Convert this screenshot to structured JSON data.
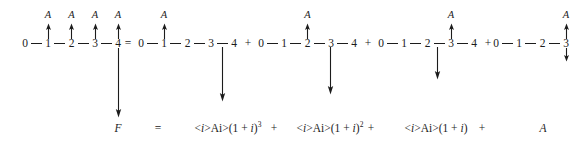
{
  "figure": {
    "kind": "cash-flow-diagram",
    "colors": {
      "ink": "#1c1c1c",
      "background": "#ffffff"
    },
    "annual_label": "A",
    "timelines": [
      {
        "id": "timeline-left",
        "nodes": [
          "0",
          "1",
          "2",
          "3",
          "4"
        ],
        "x": [
          25,
          48,
          71.5,
          95,
          118
        ],
        "arrows_up_at": [
          "1",
          "2",
          "3",
          "4"
        ]
      },
      {
        "id": "timeline-1",
        "nodes": [
          "0",
          "1",
          "2",
          "3",
          "4"
        ],
        "x": [
          141,
          164,
          187.5,
          211,
          234
        ],
        "arrows_up_at": [
          "1"
        ]
      },
      {
        "id": "timeline-2",
        "nodes": [
          "0",
          "1",
          "2",
          "3",
          "4"
        ],
        "x": [
          261,
          284,
          307.5,
          331,
          354
        ],
        "arrows_up_at": [
          "2"
        ]
      },
      {
        "id": "timeline-3",
        "nodes": [
          "0",
          "1",
          "2",
          "3",
          "4"
        ],
        "x": [
          381,
          404,
          427.5,
          451,
          474
        ],
        "arrows_up_at": [
          "3"
        ]
      },
      {
        "id": "timeline-4",
        "nodes": [
          "0",
          "1",
          "2",
          "3",
          "4"
        ],
        "x": [
          476,
          499,
          522.5,
          546,
          546
        ],
        "arrows_up_at": [
          "4"
        ],
        "arrow_down_at": [
          "4"
        ]
      }
    ],
    "operators": [
      {
        "symbol": "=",
        "x": 128
      },
      {
        "symbol": "+",
        "x": 248
      },
      {
        "symbol": "+",
        "x": 368
      },
      {
        "symbol": "+",
        "x": 488
      }
    ],
    "equation": {
      "terms": [
        {
          "text": "F",
          "italic": true,
          "x": 118,
          "y": 122
        },
        {
          "text": "=",
          "x": 158,
          "y": 122
        },
        {
          "text": "A(1 + i)",
          "exponent": "3",
          "x": 228,
          "y": 122
        },
        {
          "text": "+",
          "x": 274,
          "y": 122
        },
        {
          "text": "A(1 + i)",
          "exponent": "2",
          "x": 330,
          "y": 122
        },
        {
          "text": "+",
          "x": 371,
          "y": 122
        },
        {
          "text": "A(1 + i)",
          "exponent": "",
          "x": 436,
          "y": 122
        },
        {
          "text": "+",
          "x": 482,
          "y": 122
        },
        {
          "text": "A",
          "exponent": "",
          "x": 543,
          "y": 122
        }
      ]
    },
    "long_down_arrows": [
      {
        "x": 118,
        "y_top": 50,
        "y_bottom": 117
      },
      {
        "x": 222,
        "y_top": 48,
        "y_bottom": 100
      },
      {
        "x": 330,
        "y_top": 48,
        "y_bottom": 93
      },
      {
        "x": 437,
        "y_top": 48,
        "y_bottom": 79
      }
    ]
  }
}
